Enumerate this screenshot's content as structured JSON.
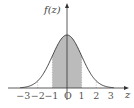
{
  "chart_data": {
    "type": "area",
    "title": "",
    "xlabel": "z",
    "ylabel": "f(z)",
    "origin_label": "O",
    "x_ticks": [
      -3,
      -2,
      -1,
      0,
      1,
      2,
      3
    ],
    "x_tick_labels": [
      "−3",
      "−2",
      "−1",
      "O",
      "1",
      "2",
      "3"
    ],
    "xlim": [
      -3.5,
      3.5
    ],
    "curve": "standard normal density f(z)",
    "shaded_region": {
      "from": -1,
      "to": 1
    },
    "dotted_guides_at": [
      -3,
      -2,
      -1,
      1,
      2,
      3
    ],
    "grid": false,
    "legend": null
  },
  "colors": {
    "curve": "#333333",
    "shade": "#bbbbbb",
    "axis": "#333333",
    "guide": "#999999"
  }
}
